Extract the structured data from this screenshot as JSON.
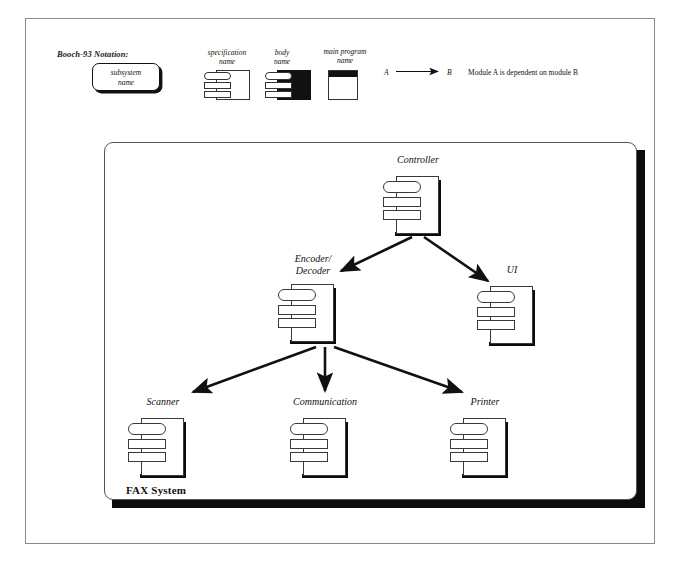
{
  "diagram": {
    "notation_label": "Booch-93 Notation:",
    "legend": {
      "subsystem_line1": "subsystem",
      "subsystem_line2": "name",
      "specification_line1": "specification",
      "specification_line2": "name",
      "body_line1": "body",
      "body_line2": "name",
      "mainprogram_line1": "main program",
      "mainprogram_line2": "name",
      "arrow_source": "A",
      "arrow_target": "B",
      "arrow_description": "Module A is dependent on module B"
    },
    "subsystem": {
      "name": "FAX System"
    },
    "nodes": [
      {
        "id": "controller",
        "label": "Controller",
        "label_line2": ""
      },
      {
        "id": "encoder",
        "label": "Encoder/",
        "label_line2": "Decoder"
      },
      {
        "id": "ui",
        "label": "UI",
        "label_line2": ""
      },
      {
        "id": "scanner",
        "label": "Scanner",
        "label_line2": ""
      },
      {
        "id": "communication",
        "label": "Communication",
        "label_line2": ""
      },
      {
        "id": "printer",
        "label": "Printer",
        "label_line2": ""
      }
    ],
    "edges": [
      {
        "from": "controller",
        "to": "encoder"
      },
      {
        "from": "controller",
        "to": "ui"
      },
      {
        "from": "encoder",
        "to": "scanner"
      },
      {
        "from": "encoder",
        "to": "communication"
      },
      {
        "from": "encoder",
        "to": "printer"
      }
    ],
    "colors": {
      "ink": "#111111",
      "sheet_stroke": "#3a3a3a",
      "shadow": "#0b0b0b",
      "frame": "#8a8a8a",
      "background": "#ffffff"
    }
  }
}
